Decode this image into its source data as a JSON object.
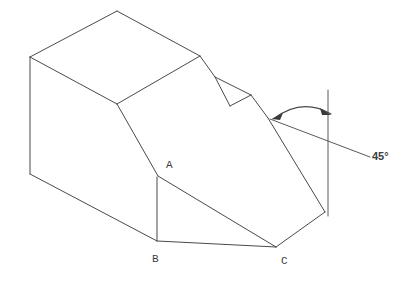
{
  "figure": {
    "type": "isometric-technical-drawing",
    "background_color": "#ffffff",
    "line_color": "#4a4a4a",
    "label_color": "#3d3d3d"
  },
  "labels": {
    "vertex_a": "A",
    "vertex_b": "B",
    "vertex_c": "C",
    "angle": "45°"
  },
  "annotations": {
    "angle_value": "45°",
    "angle_measure_degrees": 45,
    "reference_line": "vertical-datum-line",
    "arc_arrow_count": 2
  },
  "geometry": {
    "top_face": "M 30,57 L 117,11 L 200,56 L 117,104 Z",
    "left_face": "M 30,57 L 30,174 L 157,241 L 157,177 L 117,104 Z",
    "front_slope": "M 117,104 L 158,176 L 276,247 L 325,212 L 268,118 Z",
    "bottom_edge": "M 30,174 L 157,241 L 276,247",
    "vertical_edge_left": "M 30,57 L 30,174",
    "vertical_edge_ab": "M 157,177 L 157,241",
    "triangle_abc": "M 158,176 L 276,247 L 157,241 Z",
    "notch": "M 200,56 L 215,77 L 230,106 L 251,95 L 268,118",
    "notch_inner": "M 215,77 L 251,95 L 230,106",
    "datum_line": "M 328,90 L 328,216",
    "leader_line": "M 270,119 L 370,157",
    "arc": "M 272,118 Q 300,98 328,114"
  },
  "vertex_positions": {
    "a": {
      "x": 158,
      "y": 176
    },
    "b": {
      "x": 157,
      "y": 241
    },
    "c": {
      "x": 276,
      "y": 247
    }
  },
  "label_positions": {
    "a": {
      "x": 166,
      "y": 168
    },
    "b": {
      "x": 152,
      "y": 262
    },
    "c": {
      "x": 281,
      "y": 264
    },
    "angle": {
      "x": 372,
      "y": 160
    }
  }
}
